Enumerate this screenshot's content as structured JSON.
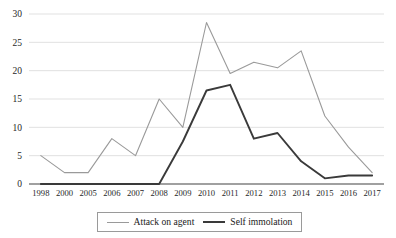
{
  "chart_data": {
    "type": "line",
    "title": "",
    "xlabel": "",
    "ylabel": "",
    "ylim": [
      0,
      30
    ],
    "ytick_step": 5,
    "grid": true,
    "legend_position": "bottom",
    "categories": [
      "1998",
      "2000",
      "2005",
      "2006",
      "2007",
      "2008",
      "2009",
      "2010",
      "2011",
      "2012",
      "2013",
      "2014",
      "2015",
      "2016",
      "2017"
    ],
    "yticks": [
      "0",
      "5",
      "10",
      "15",
      "20",
      "25",
      "30"
    ],
    "series": [
      {
        "name": "Attack on agent",
        "color": "#9a9a9a",
        "values": [
          5,
          2,
          2,
          8,
          5,
          15,
          10,
          28.5,
          19.5,
          21.5,
          20.5,
          23.5,
          12,
          6.5,
          2
        ]
      },
      {
        "name": "Self immolation",
        "color": "#3a3a3a",
        "values": [
          0,
          0,
          0,
          0,
          0,
          0,
          7.5,
          16.5,
          17.5,
          8,
          9,
          4,
          1,
          1.5,
          1.5
        ]
      }
    ]
  },
  "legend": {
    "items": [
      {
        "label": "Attack on agent",
        "color": "#9a9a9a",
        "width": "1.2px"
      },
      {
        "label": "Self immolation",
        "color": "#3a3a3a",
        "width": "2px"
      }
    ]
  }
}
